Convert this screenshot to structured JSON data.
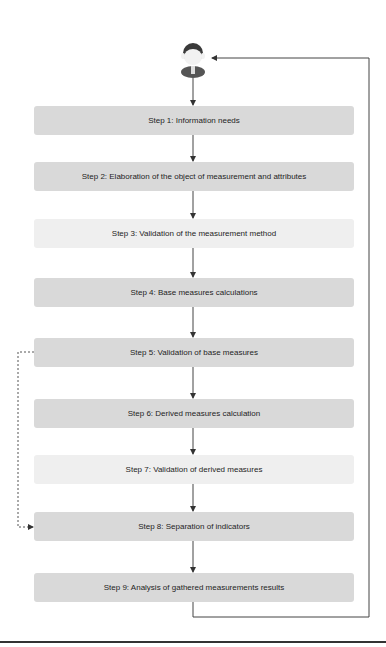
{
  "diagram": {
    "actor": {
      "icon": "user-avatar-icon"
    },
    "steps": [
      {
        "label": "Step 1: Information needs",
        "top": 106,
        "shade": "dark"
      },
      {
        "label": "Step 2: Elaboration of the object of measurement and attributes",
        "top": 162,
        "shade": "dark"
      },
      {
        "label": "Step 3: Validation of the measurement method",
        "top": 219,
        "shade": "light"
      },
      {
        "label": "Step 4: Base measures calculations",
        "top": 278,
        "shade": "dark"
      },
      {
        "label": "Step 5: Validation of base measures",
        "top": 338,
        "shade": "dark"
      },
      {
        "label": "Step 6: Derived measures calculation",
        "top": 399,
        "shade": "dark"
      },
      {
        "label": "Step 7: Validation of derived measures",
        "top": 455,
        "shade": "light"
      },
      {
        "label": "Step 8: Separation of indicators",
        "top": 512,
        "shade": "dark"
      },
      {
        "label": "Step 9: Analysis of gathered measurements results",
        "top": 573,
        "shade": "dark"
      }
    ],
    "connectors": {
      "sequential": "solid arrows between consecutive steps",
      "feedback_loop": "solid line from Step 9 back to actor",
      "skip": "dashed arrow from Step 5 to Step 8"
    },
    "colors": {
      "box_dark": "#d9d9d9",
      "box_light": "#efefef",
      "line": "#444444",
      "text": "#1e1e1e"
    }
  }
}
